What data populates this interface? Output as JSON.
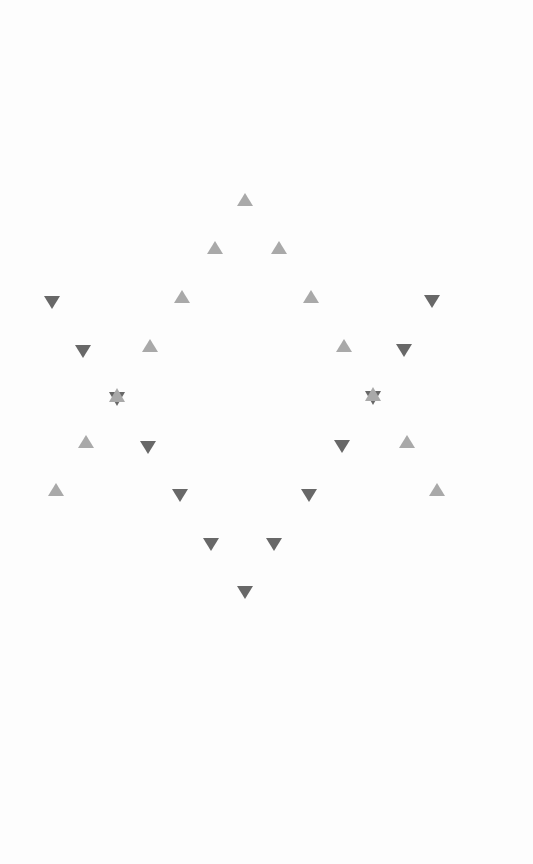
{
  "figure": {
    "colors": {
      "up_triangle": "#a9a9a9",
      "down_triangle": "#686868",
      "background": "#fdfdfd"
    },
    "up_triangles": [
      {
        "x": 245,
        "y": 200
      },
      {
        "x": 215,
        "y": 248
      },
      {
        "x": 279,
        "y": 248
      },
      {
        "x": 182,
        "y": 297
      },
      {
        "x": 311,
        "y": 297
      },
      {
        "x": 150,
        "y": 346
      },
      {
        "x": 344,
        "y": 346
      },
      {
        "x": 86,
        "y": 442
      },
      {
        "x": 407,
        "y": 442
      },
      {
        "x": 56,
        "y": 490
      },
      {
        "x": 437,
        "y": 490
      }
    ],
    "down_triangles": [
      {
        "x": 52,
        "y": 302
      },
      {
        "x": 432,
        "y": 301
      },
      {
        "x": 83,
        "y": 351
      },
      {
        "x": 404,
        "y": 350
      },
      {
        "x": 148,
        "y": 447
      },
      {
        "x": 342,
        "y": 446
      },
      {
        "x": 180,
        "y": 495
      },
      {
        "x": 309,
        "y": 495
      },
      {
        "x": 211,
        "y": 544
      },
      {
        "x": 274,
        "y": 544
      },
      {
        "x": 245,
        "y": 592
      }
    ],
    "stars": [
      {
        "x": 117,
        "y": 397
      },
      {
        "x": 373,
        "y": 396
      }
    ]
  }
}
